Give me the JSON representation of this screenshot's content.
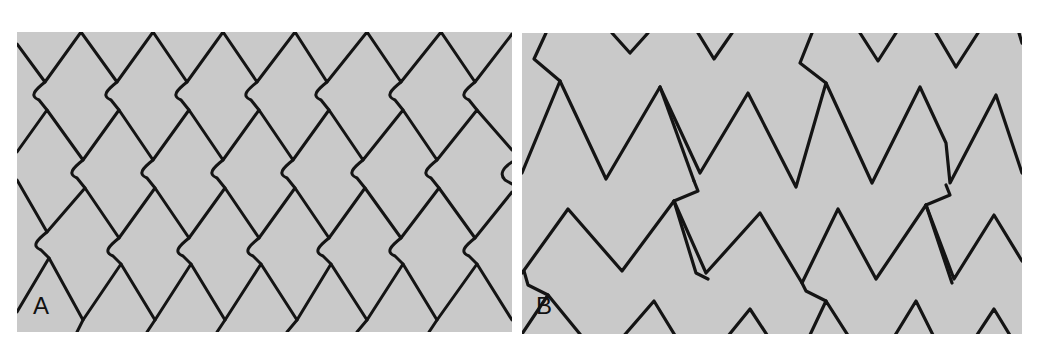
{
  "figure": {
    "panels": [
      {
        "id": "A",
        "label": "A",
        "description": "Stent strut pattern with diamond (closed-cell) geometry and S-shaped connectors"
      },
      {
        "id": "B",
        "label": "B",
        "description": "Stent strut pattern with zigzag (open-cell) rings and oblique connectors"
      }
    ],
    "colors": {
      "background": "#c9c9c9",
      "strut": "#141414",
      "page": "#ffffff"
    }
  }
}
